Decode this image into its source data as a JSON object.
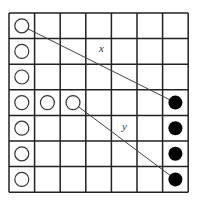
{
  "diagram": {
    "grid": {
      "rows": 7,
      "cols": 7,
      "left": 9,
      "top": 13,
      "cell": 25.6
    },
    "open_circles": [
      {
        "row": 0,
        "col": 0
      },
      {
        "row": 1,
        "col": 0
      },
      {
        "row": 2,
        "col": 0
      },
      {
        "row": 3,
        "col": 0
      },
      {
        "row": 3,
        "col": 1
      },
      {
        "row": 3,
        "col": 2
      },
      {
        "row": 4,
        "col": 0
      },
      {
        "row": 5,
        "col": 0
      },
      {
        "row": 6,
        "col": 0
      }
    ],
    "filled_circles": [
      {
        "row": 3,
        "col": 6
      },
      {
        "row": 4,
        "col": 6
      },
      {
        "row": 5,
        "col": 6
      },
      {
        "row": 6,
        "col": 6
      }
    ],
    "lines": [
      {
        "label": "x",
        "from": {
          "row": 0,
          "col": 0
        },
        "to": {
          "row": 3,
          "col": 6
        },
        "label_pos": {
          "x": 99,
          "y": 52
        }
      },
      {
        "label": "y",
        "from": {
          "row": 3,
          "col": 2
        },
        "to": {
          "row": 6,
          "col": 6
        },
        "label_pos": {
          "x": 122,
          "y": 130
        }
      }
    ]
  }
}
